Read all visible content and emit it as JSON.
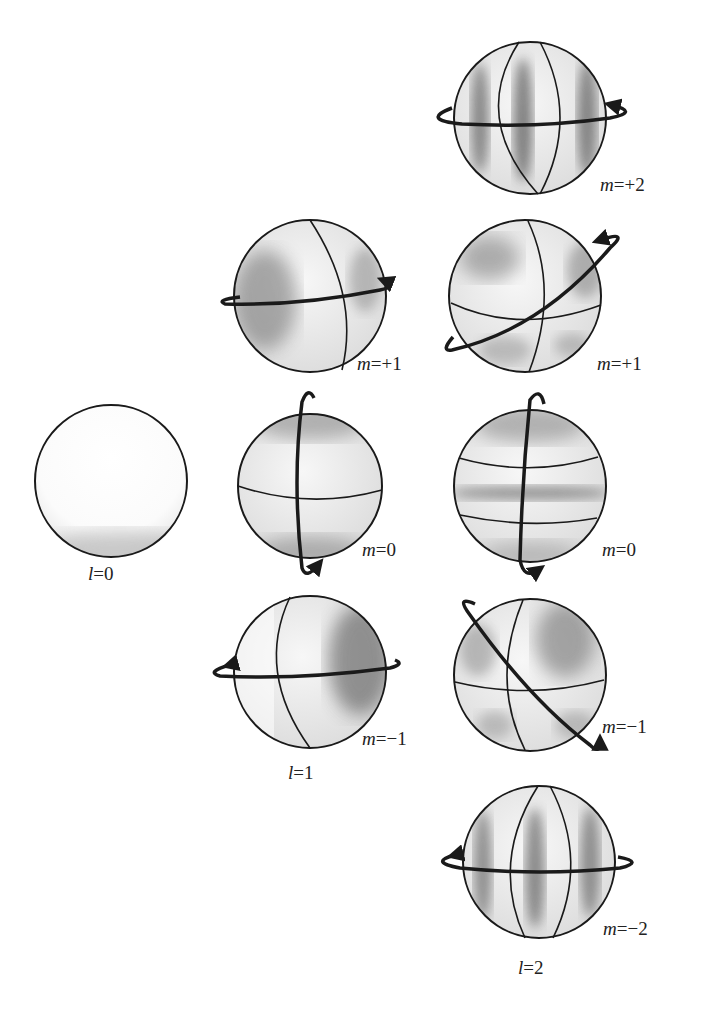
{
  "figure": {
    "colors": {
      "ink": "#1a1a1a",
      "sphere_fill": "#ececec",
      "shade": "#5a5a5a"
    }
  },
  "columns": [
    {
      "id": "l0",
      "label_var": "l",
      "label_rest": "=0",
      "spheres": [
        {
          "id": "l0-m0",
          "m_label": "",
          "cx": 111,
          "cy": 481,
          "r": 76,
          "style": "plain"
        }
      ]
    },
    {
      "id": "l1",
      "label_var": "l",
      "label_rest": "=1",
      "spheres": [
        {
          "id": "l1-mp1",
          "m_var": "m",
          "m_rest": "=+1",
          "cx": 310,
          "cy": 296,
          "r": 76
        },
        {
          "id": "l1-m0",
          "m_var": "m",
          "m_rest": "=0",
          "cx": 310,
          "cy": 486,
          "r": 72
        },
        {
          "id": "l1-mm1",
          "m_var": "m",
          "m_rest": "=−1",
          "cx": 310,
          "cy": 672,
          "r": 76
        }
      ]
    },
    {
      "id": "l2",
      "label_var": "l",
      "label_rest": "=2",
      "spheres": [
        {
          "id": "l2-mp2",
          "m_var": "m",
          "m_rest": "=+2",
          "cx": 530,
          "cy": 118,
          "r": 76
        },
        {
          "id": "l2-mp1",
          "m_var": "m",
          "m_rest": "=+1",
          "cx": 525,
          "cy": 296,
          "r": 76
        },
        {
          "id": "l2-m0",
          "m_var": "m",
          "m_rest": "=0",
          "cx": 530,
          "cy": 486,
          "r": 76
        },
        {
          "id": "l2-mm1",
          "m_var": "m",
          "m_rest": "=−1",
          "cx": 530,
          "cy": 675,
          "r": 76
        },
        {
          "id": "l2-mm2",
          "m_var": "m",
          "m_rest": "=−2",
          "cx": 539,
          "cy": 862,
          "r": 76
        }
      ]
    }
  ]
}
